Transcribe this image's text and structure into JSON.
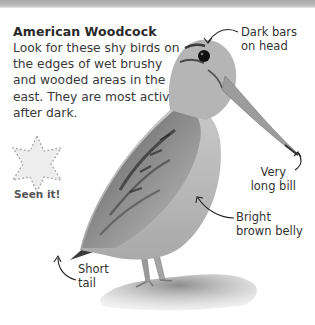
{
  "header": {
    "title": "American Woodcock",
    "description": "Look for these shy birds on the edges of wet brushy and wooded areas in the east. They are most active after dark."
  },
  "checkbox": {
    "label": "Seen it!",
    "icon": "star-outline-icon",
    "checked": false
  },
  "callouts": {
    "head": {
      "line1": "Dark bars",
      "line2": "on head"
    },
    "bill": {
      "line1": "Very",
      "line2": "long bill"
    },
    "belly": {
      "line1": "Bright",
      "line2": "brown belly"
    },
    "tail": {
      "line1": "Short",
      "line2": "tail"
    }
  },
  "colors": {
    "band": "#b0b0b0",
    "text": "#333333",
    "star_fill": "#ececec",
    "star_stroke": "#9a9a9a"
  }
}
